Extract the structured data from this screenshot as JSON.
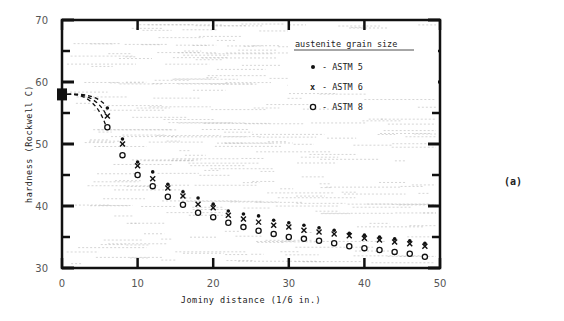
{
  "chart_data": {
    "type": "scatter",
    "title": "",
    "panel_label": "(a)",
    "xlabel": "Jominy distance (1/6 in.)",
    "ylabel": "hardness (Rockwell C)",
    "xlim": [
      0,
      50
    ],
    "ylim": [
      30,
      70
    ],
    "x_ticks": [
      0,
      10,
      20,
      30,
      40,
      50
    ],
    "y_ticks": [
      30,
      40,
      50,
      60,
      70
    ],
    "grid": false,
    "legend": {
      "title": "austenite grain size",
      "position": "upper right",
      "entries": [
        {
          "marker": "•",
          "label": "- ASTM 5"
        },
        {
          "marker": "x",
          "label": "- ASTM 6"
        },
        {
          "marker": "o",
          "label": "- ASTM 8"
        }
      ]
    },
    "start_point": {
      "x": 0,
      "y": 58,
      "marker": "square"
    },
    "x": [
      6,
      8,
      10,
      12,
      14,
      16,
      18,
      20,
      22,
      24,
      26,
      28,
      30,
      32,
      34,
      36,
      38,
      40,
      42,
      44,
      46,
      48
    ],
    "series": [
      {
        "name": "ASTM 5",
        "marker": "dot",
        "values": [
          55.8,
          50.8,
          47.1,
          45.5,
          43.5,
          42.3,
          41.3,
          40.3,
          39.2,
          38.7,
          38.4,
          37.7,
          37.3,
          36.9,
          36.5,
          36.1,
          35.6,
          35.3,
          35.0,
          34.7,
          34.4,
          34.0
        ]
      },
      {
        "name": "ASTM 6",
        "marker": "x",
        "values": [
          54.5,
          50.0,
          46.5,
          44.4,
          42.9,
          41.6,
          40.3,
          39.7,
          38.5,
          37.9,
          37.4,
          36.9,
          36.6,
          36.1,
          35.8,
          35.5,
          35.2,
          34.8,
          34.5,
          34.2,
          33.9,
          33.5
        ]
      },
      {
        "name": "ASTM 8",
        "marker": "circle",
        "values": [
          52.7,
          48.2,
          45.0,
          43.2,
          41.5,
          40.2,
          38.9,
          38.2,
          37.3,
          36.6,
          36.0,
          35.5,
          35.0,
          34.7,
          34.4,
          34.0,
          33.5,
          33.2,
          32.9,
          32.6,
          32.3,
          31.8
        ]
      }
    ],
    "annotations": [
      "dashed curves connecting start point (0, 58) to first data points at x=6"
    ]
  }
}
